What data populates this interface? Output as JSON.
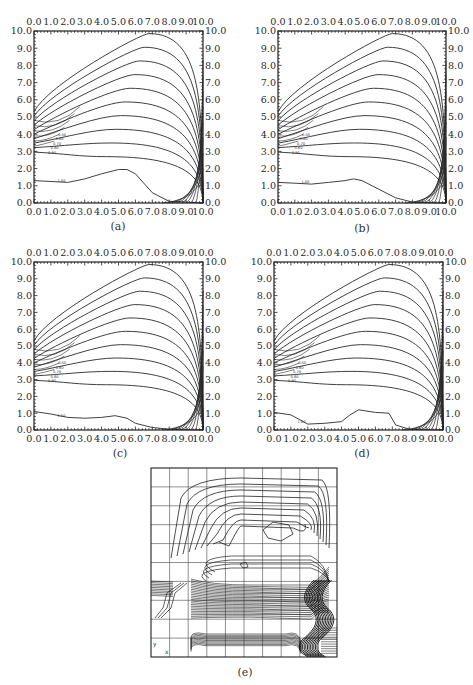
{
  "figure": {
    "panels": [
      {
        "id": "a",
        "caption": "(a)"
      },
      {
        "id": "b",
        "caption": "(b)"
      },
      {
        "id": "c",
        "caption": "(c)"
      },
      {
        "id": "d",
        "caption": "(d)"
      },
      {
        "id": "e",
        "caption": "(e)"
      }
    ],
    "axis_ticks": [
      "0.0",
      "1.0",
      "2.0",
      "3.0",
      "4.0",
      "5.0",
      "6.0",
      "7.0",
      "8.0",
      "9.0",
      "10.0"
    ],
    "contour_labels": [
      "1.00",
      "0.90",
      "0.80",
      "0.70",
      "0.60",
      "0.50"
    ]
  },
  "chart_data": [
    {
      "type": "contour",
      "panel": "a",
      "title": "(a)",
      "xlim": [
        0,
        10
      ],
      "ylim": [
        0,
        10
      ],
      "xticks": [
        "0.0",
        "1.0",
        "2.0",
        "3.0",
        "4.0",
        "5.0",
        "6.0",
        "7.0",
        "8.0",
        "9.0",
        "10.0"
      ],
      "yticks": [
        "0.0",
        "1.0",
        "2.0",
        "3.0",
        "4.0",
        "5.0",
        "6.0",
        "7.0",
        "8.0",
        "9.0",
        "10.0"
      ],
      "axes": "ticks on all four sides",
      "contour_levels_labeled": [
        "1.00",
        "0.90",
        "0.80"
      ],
      "lowest_contour_profile": {
        "x": [
          0,
          1,
          2,
          3,
          4,
          5,
          5.5,
          6,
          7,
          8,
          9,
          10
        ],
        "y": [
          1.3,
          1.25,
          1.2,
          1.4,
          1.7,
          1.95,
          1.95,
          1.7,
          0.6,
          0.1,
          0.05,
          0
        ]
      },
      "peak_contour_top_y": 9.8
    },
    {
      "type": "contour",
      "panel": "b",
      "title": "(b)",
      "xlim": [
        0,
        10
      ],
      "ylim": [
        0,
        10
      ],
      "xticks": [
        "0.0",
        "1.0",
        "2.0",
        "3.0",
        "4.0",
        "5.0",
        "6.0",
        "7.0",
        "8.0",
        "9.0",
        "10.0"
      ],
      "yticks": [
        "0.0",
        "1.0",
        "2.0",
        "3.0",
        "4.0",
        "5.0",
        "6.0",
        "7.0",
        "8.0",
        "9.0",
        "10.0"
      ],
      "contour_levels_labeled": [
        "1.00",
        "0.90",
        "0.80"
      ],
      "lowest_contour_profile": {
        "x": [
          0,
          1,
          2,
          3,
          4,
          4.5,
          5,
          6,
          7,
          8,
          9,
          10
        ],
        "y": [
          1.2,
          1.15,
          1.1,
          1.2,
          1.3,
          1.4,
          1.3,
          0.8,
          0.3,
          0.05,
          0.02,
          0
        ]
      }
    },
    {
      "type": "contour",
      "panel": "c",
      "title": "(c)",
      "xlim": [
        0,
        10
      ],
      "ylim": [
        0,
        10
      ],
      "xticks": [
        "0.0",
        "1.0",
        "2.0",
        "3.0",
        "4.0",
        "5.0",
        "6.0",
        "7.0",
        "8.0",
        "9.0",
        "10.0"
      ],
      "yticks": [
        "0.0",
        "1.0",
        "2.0",
        "3.0",
        "4.0",
        "5.0",
        "6.0",
        "7.0",
        "8.0",
        "9.0",
        "10.0"
      ],
      "contour_levels_labeled": [
        "1.00",
        "0.90",
        "0.80"
      ],
      "lowest_contour_profile": {
        "x": [
          0,
          1,
          2,
          3,
          4,
          4.8,
          5.5,
          6,
          7,
          8,
          9,
          10
        ],
        "y": [
          1.1,
          0.95,
          0.75,
          0.7,
          0.75,
          0.85,
          0.7,
          0.4,
          0.15,
          0.05,
          0.02,
          0
        ]
      }
    },
    {
      "type": "contour",
      "panel": "d",
      "title": "(d)",
      "xlim": [
        0,
        10
      ],
      "ylim": [
        0,
        10
      ],
      "xticks": [
        "0.0",
        "1.0",
        "2.0",
        "3.0",
        "4.0",
        "5.0",
        "6.0",
        "7.0",
        "8.0",
        "9.0",
        "10.0"
      ],
      "yticks": [
        "0.0",
        "1.0",
        "2.0",
        "3.0",
        "4.0",
        "5.0",
        "6.0",
        "7.0",
        "8.0",
        "9.0",
        "10.0"
      ],
      "contour_levels_labeled": [
        "1.00",
        "0.90",
        "0.80"
      ],
      "lowest_contour_profile": {
        "x": [
          0,
          1,
          2,
          3,
          4,
          4.5,
          5,
          6,
          6.8,
          7.2,
          8,
          9,
          10
        ],
        "y": [
          1.05,
          0.9,
          0.35,
          0.4,
          0.5,
          0.9,
          1.2,
          1.05,
          1.0,
          0.3,
          0.05,
          0.02,
          0
        ]
      }
    },
    {
      "type": "contour",
      "panel": "e",
      "title": "(e)",
      "grid": "10x10 mesh",
      "axes_labels": {
        "x": "x",
        "y": "y"
      },
      "notes": "finite-element mesh with dense horizontal contour bands near mid-height and lower region; small closed contour in upper right"
    }
  ]
}
